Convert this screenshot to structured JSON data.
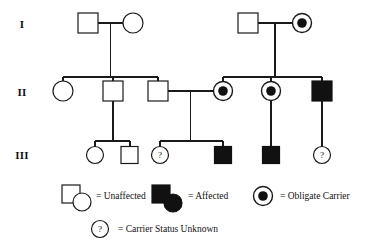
{
  "figure": {
    "type": "pedigree-chart",
    "background_color": "#ffffff",
    "line_color": "#1a1a1a",
    "fill_color": "#111111"
  },
  "generation_labels": [
    {
      "id": "gen-1",
      "text": "I",
      "x": 22,
      "y": 28
    },
    {
      "id": "gen-2",
      "text": "II",
      "x": 20,
      "y": 96
    },
    {
      "id": "gen-3",
      "text": "III",
      "x": 18,
      "y": 159
    }
  ],
  "individuals": [
    {
      "id": "I-1",
      "generation": "I",
      "sex": "male",
      "status": "unaffected",
      "shape": "square",
      "cx": 88,
      "cy": 23
    },
    {
      "id": "I-2",
      "generation": "I",
      "sex": "female",
      "status": "unaffected",
      "shape": "circle",
      "cx": 133,
      "cy": 23
    },
    {
      "id": "I-3",
      "generation": "I",
      "sex": "male",
      "status": "unaffected",
      "shape": "square",
      "cx": 248,
      "cy": 23
    },
    {
      "id": "I-4",
      "generation": "I",
      "sex": "female",
      "status": "obligate-carrier",
      "shape": "circle",
      "cx": 302,
      "cy": 23
    },
    {
      "id": "II-1",
      "generation": "II",
      "sex": "female",
      "status": "unaffected",
      "shape": "circle",
      "cx": 63,
      "cy": 91
    },
    {
      "id": "II-2",
      "generation": "II",
      "sex": "male",
      "status": "unaffected",
      "shape": "square",
      "cx": 113,
      "cy": 91
    },
    {
      "id": "II-3",
      "generation": "II",
      "sex": "male",
      "status": "unaffected",
      "shape": "square",
      "cx": 158,
      "cy": 91
    },
    {
      "id": "II-4",
      "generation": "II",
      "sex": "female",
      "status": "obligate-carrier",
      "shape": "circle",
      "cx": 223,
      "cy": 91
    },
    {
      "id": "II-5",
      "generation": "II",
      "sex": "female",
      "status": "obligate-carrier",
      "shape": "circle",
      "cx": 271,
      "cy": 91
    },
    {
      "id": "II-6",
      "generation": "II",
      "sex": "male",
      "status": "affected",
      "shape": "square",
      "cx": 322,
      "cy": 91
    },
    {
      "id": "III-1",
      "generation": "III",
      "sex": "female",
      "status": "unaffected",
      "shape": "circle",
      "cx": 95,
      "cy": 155
    },
    {
      "id": "III-2",
      "generation": "III",
      "sex": "male",
      "status": "unaffected",
      "shape": "square",
      "cx": 130,
      "cy": 155
    },
    {
      "id": "III-3",
      "generation": "III",
      "sex": "female",
      "status": "carrier-status-unknown",
      "shape": "circle",
      "cx": 160,
      "cy": 155
    },
    {
      "id": "III-4",
      "generation": "III",
      "sex": "male",
      "status": "affected",
      "shape": "square",
      "cx": 223,
      "cy": 155
    },
    {
      "id": "III-5",
      "generation": "III",
      "sex": "male",
      "status": "affected",
      "shape": "square",
      "cx": 271,
      "cy": 155
    },
    {
      "id": "III-6",
      "generation": "III",
      "sex": "female",
      "status": "carrier-status-unknown",
      "shape": "circle",
      "cx": 322,
      "cy": 155
    }
  ],
  "legend": {
    "items": [
      {
        "id": "legend-unaffected",
        "label": "= Unaffected",
        "symbol": "open-square-and-circle",
        "text_x": 96,
        "text_y": 199
      },
      {
        "id": "legend-affected",
        "label": "= Affected",
        "symbol": "filled-square-and-circle",
        "text_x": 188,
        "text_y": 199
      },
      {
        "id": "legend-obligate-carrier",
        "label": "= Obligate Carrier",
        "symbol": "dotted-circle",
        "text_x": 280,
        "text_y": 199
      },
      {
        "id": "legend-unknown",
        "label": "= Carrier Status Unknown",
        "symbol": "question-circle",
        "text_x": 118,
        "text_y": 232
      }
    ],
    "question_mark": "?"
  }
}
